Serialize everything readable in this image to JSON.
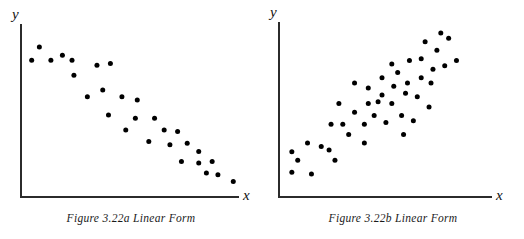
{
  "figure": {
    "panels": [
      {
        "id": "panel-a",
        "caption": "Figure 3.22a Linear Form",
        "x_axis_label": "x",
        "y_axis_label": "y"
      },
      {
        "id": "panel-b",
        "caption": "Figure 3.22b Linear Form",
        "x_axis_label": "x",
        "y_axis_label": "y"
      }
    ]
  },
  "chart_data": [
    {
      "type": "scatter",
      "title": "Figure 3.22a Linear Form",
      "xlabel": "x",
      "ylabel": "y",
      "grid": false,
      "legend": "none",
      "axes": "open L-shaped axes, no tick marks, no tick labels",
      "relationship": "negative linear",
      "xlim": [
        0,
        100
      ],
      "ylim": [
        0,
        100
      ],
      "n_points": 31,
      "marker": {
        "shape": "circle",
        "color": "#000000",
        "size_px": 5
      },
      "points": [
        {
          "x": 8,
          "y": 88
        },
        {
          "x": 14,
          "y": 80
        },
        {
          "x": 4,
          "y": 80
        },
        {
          "x": 20,
          "y": 83
        },
        {
          "x": 25,
          "y": 80
        },
        {
          "x": 26,
          "y": 71
        },
        {
          "x": 38,
          "y": 77
        },
        {
          "x": 45,
          "y": 78
        },
        {
          "x": 41,
          "y": 62
        },
        {
          "x": 33,
          "y": 58
        },
        {
          "x": 51,
          "y": 58
        },
        {
          "x": 59,
          "y": 56
        },
        {
          "x": 44,
          "y": 47
        },
        {
          "x": 58,
          "y": 45
        },
        {
          "x": 68,
          "y": 45
        },
        {
          "x": 53,
          "y": 38
        },
        {
          "x": 73,
          "y": 38
        },
        {
          "x": 80,
          "y": 37
        },
        {
          "x": 65,
          "y": 31
        },
        {
          "x": 76,
          "y": 29
        },
        {
          "x": 85,
          "y": 30
        },
        {
          "x": 91,
          "y": 25
        },
        {
          "x": 82,
          "y": 19
        },
        {
          "x": 91,
          "y": 18
        },
        {
          "x": 98,
          "y": 19
        },
        {
          "x": 95,
          "y": 12
        },
        {
          "x": 101,
          "y": 11
        },
        {
          "x": 109,
          "y": 7
        }
      ]
    },
    {
      "type": "scatter",
      "title": "Figure 3.22b Linear Form",
      "xlabel": "x",
      "ylabel": "y",
      "grid": false,
      "legend": "none",
      "axes": "open L-shaped axes, no tick marks, no tick labels",
      "relationship": "positive linear",
      "xlim": [
        0,
        100
      ],
      "ylim": [
        0,
        100
      ],
      "n_points": 44,
      "marker": {
        "shape": "circle",
        "color": "#000000",
        "size_px": 5
      },
      "points": [
        {
          "x": 4,
          "y": 24
        },
        {
          "x": 7,
          "y": 19
        },
        {
          "x": 4,
          "y": 12
        },
        {
          "x": 12,
          "y": 29
        },
        {
          "x": 14,
          "y": 11
        },
        {
          "x": 19,
          "y": 27
        },
        {
          "x": 23,
          "y": 25
        },
        {
          "x": 26,
          "y": 19
        },
        {
          "x": 24,
          "y": 40
        },
        {
          "x": 30,
          "y": 40
        },
        {
          "x": 28,
          "y": 52
        },
        {
          "x": 33,
          "y": 34
        },
        {
          "x": 36,
          "y": 47
        },
        {
          "x": 36,
          "y": 64
        },
        {
          "x": 41,
          "y": 29
        },
        {
          "x": 41,
          "y": 40
        },
        {
          "x": 43,
          "y": 52
        },
        {
          "x": 43,
          "y": 61
        },
        {
          "x": 46,
          "y": 45
        },
        {
          "x": 48,
          "y": 53
        },
        {
          "x": 50,
          "y": 57
        },
        {
          "x": 50,
          "y": 67
        },
        {
          "x": 52,
          "y": 41
        },
        {
          "x": 55,
          "y": 52
        },
        {
          "x": 56,
          "y": 62
        },
        {
          "x": 55,
          "y": 75
        },
        {
          "x": 58,
          "y": 70
        },
        {
          "x": 60,
          "y": 45
        },
        {
          "x": 61,
          "y": 34
        },
        {
          "x": 62,
          "y": 58
        },
        {
          "x": 63,
          "y": 64
        },
        {
          "x": 64,
          "y": 77
        },
        {
          "x": 66,
          "y": 42
        },
        {
          "x": 68,
          "y": 56
        },
        {
          "x": 70,
          "y": 67
        },
        {
          "x": 70,
          "y": 78
        },
        {
          "x": 72,
          "y": 88
        },
        {
          "x": 74,
          "y": 50
        },
        {
          "x": 75,
          "y": 64
        },
        {
          "x": 76,
          "y": 72
        },
        {
          "x": 78,
          "y": 83
        },
        {
          "x": 80,
          "y": 93
        },
        {
          "x": 82,
          "y": 74
        },
        {
          "x": 84,
          "y": 90
        },
        {
          "x": 88,
          "y": 77
        }
      ]
    }
  ]
}
